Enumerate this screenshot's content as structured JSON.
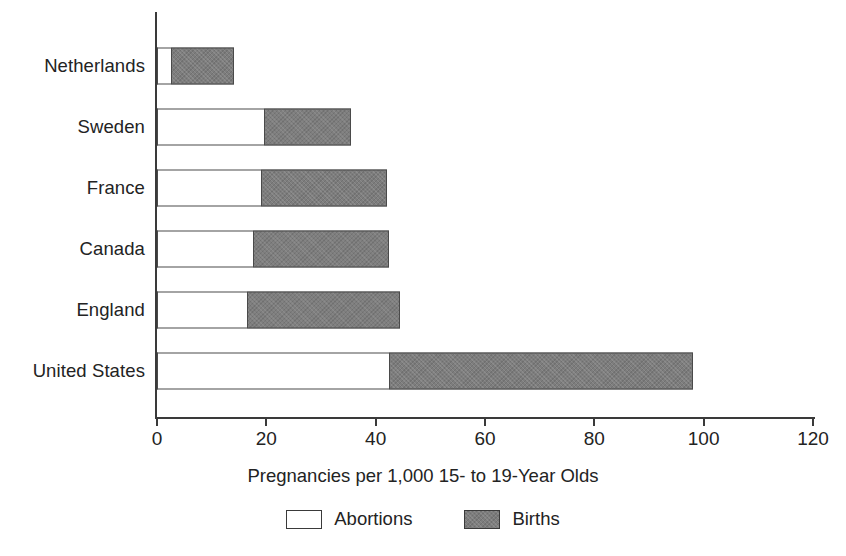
{
  "chart_data": {
    "type": "bar",
    "orientation": "horizontal",
    "stacked": true,
    "title": "",
    "xlabel": "Pregnancies per 1,000 15- to 19-Year Olds",
    "ylabel": "",
    "xlim": [
      0,
      120
    ],
    "xticks": [
      0,
      20,
      40,
      60,
      80,
      100,
      120
    ],
    "xtick_labels": [
      "0",
      "20",
      "40",
      "60",
      "80",
      "100",
      "120"
    ],
    "grid": false,
    "legend_position": "bottom",
    "categories": [
      "Netherlands",
      "Sweden",
      "France",
      "Canada",
      "England",
      "United States"
    ],
    "series": [
      {
        "name": "Abortions",
        "color": "#ffffff",
        "values": [
          2.5,
          19.5,
          19.0,
          17.5,
          16.5,
          42.5
        ]
      },
      {
        "name": "Births",
        "color": "#7d7d7d",
        "values": [
          11.5,
          16.0,
          23.0,
          25.0,
          28.0,
          55.5
        ]
      }
    ],
    "totals": [
      14.0,
      35.5,
      42.0,
      42.5,
      44.5,
      98.0
    ]
  },
  "legend": {
    "items": [
      {
        "label": "Abortions",
        "swatch": "white"
      },
      {
        "label": "Births",
        "swatch": "gray"
      }
    ]
  }
}
